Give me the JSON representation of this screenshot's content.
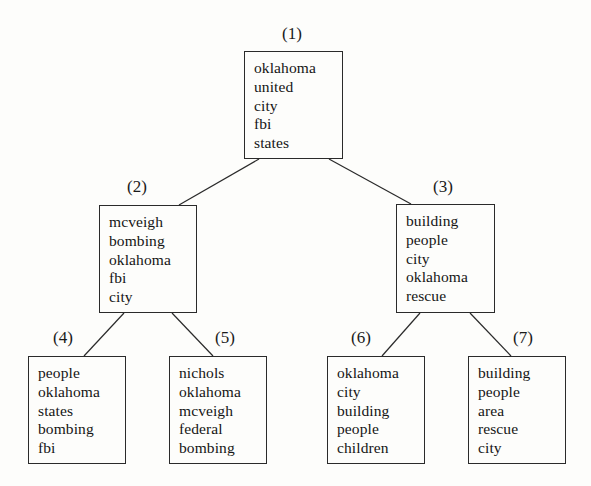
{
  "figure": {
    "background_color": "#fdfdfb",
    "line_color": "#2a2a2a",
    "text_color": "#151515"
  },
  "nodes": [
    {
      "id": "1",
      "label": "(1)",
      "terms": [
        "oklahoma",
        "united",
        "city",
        "fbi",
        "states"
      ],
      "box": {
        "x": 244,
        "y": 51,
        "w": 99,
        "h": 108
      },
      "label_pos": {
        "x": 282,
        "y": 25
      }
    },
    {
      "id": "2",
      "label": "(2)",
      "terms": [
        "mcveigh",
        "bombing",
        "oklahoma",
        "fbi",
        "city"
      ],
      "box": {
        "x": 99,
        "y": 205,
        "w": 98,
        "h": 108
      },
      "label_pos": {
        "x": 127,
        "y": 178
      }
    },
    {
      "id": "3",
      "label": "(3)",
      "terms": [
        "building",
        "people",
        "city",
        "oklahoma",
        "rescue"
      ],
      "box": {
        "x": 396,
        "y": 204,
        "w": 99,
        "h": 109
      },
      "label_pos": {
        "x": 433,
        "y": 178
      }
    },
    {
      "id": "4",
      "label": "(4)",
      "terms": [
        "people",
        "oklahoma",
        "states",
        "bombing",
        "fbi"
      ],
      "box": {
        "x": 28,
        "y": 356,
        "w": 98,
        "h": 108
      },
      "label_pos": {
        "x": 53,
        "y": 329
      }
    },
    {
      "id": "5",
      "label": "(5)",
      "terms": [
        "nichols",
        "oklahoma",
        "mcveigh",
        "federal",
        "bombing"
      ],
      "box": {
        "x": 169,
        "y": 356,
        "w": 98,
        "h": 108
      },
      "label_pos": {
        "x": 215,
        "y": 329
      }
    },
    {
      "id": "6",
      "label": "(6)",
      "terms": [
        "oklahoma",
        "city",
        "building",
        "people",
        "children"
      ],
      "box": {
        "x": 327,
        "y": 356,
        "w": 98,
        "h": 108
      },
      "label_pos": {
        "x": 351,
        "y": 329
      }
    },
    {
      "id": "7",
      "label": "(7)",
      "terms": [
        "building",
        "people",
        "area",
        "rescue",
        "city"
      ],
      "box": {
        "x": 468,
        "y": 356,
        "w": 98,
        "h": 108
      },
      "label_pos": {
        "x": 513,
        "y": 329
      }
    }
  ],
  "edges": [
    {
      "from": "1",
      "to": "2",
      "x1": 259,
      "y1": 159,
      "x2": 179,
      "y2": 205
    },
    {
      "from": "1",
      "to": "3",
      "x1": 329,
      "y1": 159,
      "x2": 411,
      "y2": 204
    },
    {
      "from": "2",
      "to": "4",
      "x1": 124,
      "y1": 313,
      "x2": 84,
      "y2": 356
    },
    {
      "from": "2",
      "to": "5",
      "x1": 172,
      "y1": 313,
      "x2": 213,
      "y2": 356
    },
    {
      "from": "3",
      "to": "6",
      "x1": 420,
      "y1": 313,
      "x2": 382,
      "y2": 356
    },
    {
      "from": "3",
      "to": "7",
      "x1": 470,
      "y1": 313,
      "x2": 511,
      "y2": 356
    }
  ]
}
